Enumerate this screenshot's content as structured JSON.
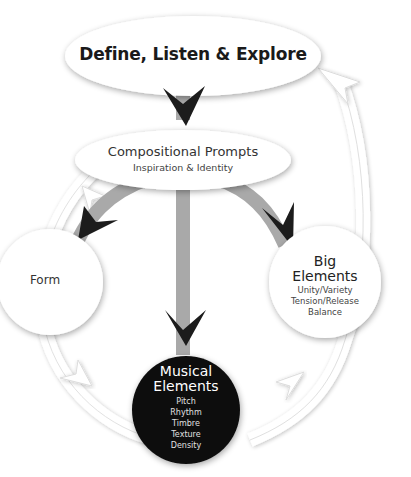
{
  "diagram": {
    "top_node": {
      "label": "Define, Listen & Explore"
    },
    "prompts_node": {
      "title": "Compositional Prompts",
      "subtitle": "Inspiration & Identity"
    },
    "form_node": {
      "label": "Form"
    },
    "big_elements_node": {
      "title_line1": "Big",
      "title_line2": "Elements",
      "items": [
        "Unity/Variety",
        "Tension/Release",
        "Balance"
      ]
    },
    "musical_elements_node": {
      "title_line1": "Musical",
      "title_line2": "Elements",
      "items": [
        "Pitch",
        "Rhythm",
        "Timbre",
        "Texture",
        "Density"
      ]
    },
    "colors": {
      "node_fill": "#ffffff",
      "node_shadow": "#cfcfcf",
      "stem_gray": "#a9a9a9",
      "arrowhead": "#1c1c1c",
      "dark_node": "#111111",
      "cycle_outline": "#d8d8d8"
    }
  }
}
